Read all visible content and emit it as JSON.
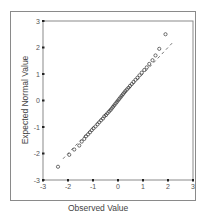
{
  "chart_data": {
    "type": "scatter",
    "title": "",
    "xlabel": "Observed Value",
    "ylabel": "Expected Normal Value",
    "xlim": [
      -3,
      3
    ],
    "ylim": [
      -3,
      3
    ],
    "x_ticks": [
      "-3",
      "-2",
      "-1",
      "0",
      "1",
      "2",
      "3"
    ],
    "y_ticks": [
      "3",
      "2",
      "1",
      "0",
      "-1",
      "-2",
      "-3"
    ],
    "grid": false,
    "legend": null,
    "reference_line": {
      "style": "dashed",
      "from": [
        -2.2,
        -2.2
      ],
      "to": [
        2.2,
        2.2
      ]
    },
    "series": [
      {
        "name": "Normal Q-Q",
        "marker": "open-circle",
        "points": [
          [
            -2.4,
            -2.5
          ],
          [
            -1.95,
            -2.05
          ],
          [
            -1.75,
            -1.85
          ],
          [
            -1.55,
            -1.7
          ],
          [
            -1.45,
            -1.55
          ],
          [
            -1.35,
            -1.45
          ],
          [
            -1.28,
            -1.35
          ],
          [
            -1.2,
            -1.28
          ],
          [
            -1.12,
            -1.2
          ],
          [
            -1.05,
            -1.12
          ],
          [
            -0.98,
            -1.05
          ],
          [
            -0.9,
            -0.98
          ],
          [
            -0.82,
            -0.9
          ],
          [
            -0.75,
            -0.82
          ],
          [
            -0.68,
            -0.75
          ],
          [
            -0.6,
            -0.68
          ],
          [
            -0.55,
            -0.6
          ],
          [
            -0.48,
            -0.55
          ],
          [
            -0.42,
            -0.48
          ],
          [
            -0.36,
            -0.42
          ],
          [
            -0.3,
            -0.36
          ],
          [
            -0.25,
            -0.3
          ],
          [
            -0.2,
            -0.24
          ],
          [
            -0.15,
            -0.18
          ],
          [
            -0.1,
            -0.12
          ],
          [
            -0.05,
            -0.06
          ],
          [
            0.0,
            0.0
          ],
          [
            0.05,
            0.06
          ],
          [
            0.1,
            0.12
          ],
          [
            0.15,
            0.18
          ],
          [
            0.2,
            0.24
          ],
          [
            0.25,
            0.3
          ],
          [
            0.3,
            0.36
          ],
          [
            0.36,
            0.42
          ],
          [
            0.42,
            0.48
          ],
          [
            0.48,
            0.55
          ],
          [
            0.55,
            0.62
          ],
          [
            0.62,
            0.7
          ],
          [
            0.7,
            0.78
          ],
          [
            0.78,
            0.86
          ],
          [
            0.86,
            0.95
          ],
          [
            0.95,
            1.05
          ],
          [
            1.05,
            1.15
          ],
          [
            1.15,
            1.25
          ],
          [
            1.25,
            1.38
          ],
          [
            1.38,
            1.52
          ],
          [
            1.5,
            1.7
          ],
          [
            1.65,
            1.95
          ],
          [
            1.9,
            2.5
          ]
        ]
      }
    ]
  }
}
